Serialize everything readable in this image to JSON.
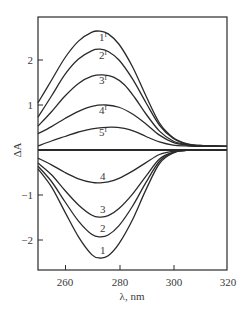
{
  "chart_data": {
    "type": "line",
    "title": "",
    "xlabel": "λ, nm",
    "ylabel": "ΔA",
    "xlim": [
      250,
      320
    ],
    "ylim": [
      -2.7,
      2.95
    ],
    "grid": false,
    "legend": "none (curves labeled inline)",
    "x_ticks": [
      260,
      280,
      300,
      320
    ],
    "x_tick_labels": [
      "260",
      "280",
      "300",
      "320"
    ],
    "y_ticks": [
      2,
      1,
      -1,
      -2
    ],
    "y_tick_labels": [
      "2",
      "1",
      "−1",
      "−2"
    ],
    "series": [
      {
        "name": "1'",
        "label": "1",
        "sup": "I",
        "label_pos": [
          274,
          2.42
        ],
        "x": [
          250,
          255,
          260,
          265,
          270,
          273,
          276,
          280,
          285,
          290,
          295,
          300,
          305,
          310,
          320
        ],
        "values": [
          1.05,
          1.55,
          2.05,
          2.42,
          2.62,
          2.64,
          2.58,
          2.35,
          1.85,
          1.2,
          0.6,
          0.28,
          0.14,
          0.1,
          0.08
        ]
      },
      {
        "name": "2'",
        "label": "2",
        "sup": "I",
        "label_pos": [
          274,
          2.02
        ],
        "x": [
          250,
          255,
          260,
          265,
          270,
          273,
          276,
          280,
          285,
          290,
          295,
          300,
          305,
          310,
          320
        ],
        "values": [
          0.73,
          1.2,
          1.68,
          2.02,
          2.21,
          2.24,
          2.19,
          2.0,
          1.58,
          1.05,
          0.55,
          0.26,
          0.13,
          0.1,
          0.08
        ]
      },
      {
        "name": "3'",
        "label": "3",
        "sup": "I",
        "label_pos": [
          274,
          1.46
        ],
        "x": [
          250,
          255,
          260,
          265,
          270,
          274,
          278,
          282,
          286,
          290,
          295,
          300,
          305,
          310,
          320
        ],
        "values": [
          0.53,
          0.85,
          1.2,
          1.48,
          1.64,
          1.67,
          1.62,
          1.45,
          1.15,
          0.8,
          0.42,
          0.2,
          0.12,
          0.09,
          0.08
        ]
      },
      {
        "name": "4'",
        "label": "4",
        "sup": "I",
        "label_pos": [
          274,
          0.8
        ],
        "x": [
          250,
          255,
          260,
          265,
          270,
          275,
          280,
          285,
          290,
          295,
          300,
          305,
          310,
          320
        ],
        "values": [
          0.36,
          0.52,
          0.7,
          0.86,
          0.97,
          1.0,
          0.95,
          0.8,
          0.58,
          0.33,
          0.17,
          0.11,
          0.09,
          0.08
        ]
      },
      {
        "name": "5'",
        "label": "5",
        "sup": "I",
        "label_pos": [
          274,
          0.32
        ],
        "x": [
          250,
          255,
          260,
          265,
          270,
          277,
          282,
          286,
          290,
          295,
          300,
          305,
          310,
          320
        ],
        "values": [
          0.09,
          0.2,
          0.3,
          0.4,
          0.47,
          0.51,
          0.48,
          0.41,
          0.3,
          0.18,
          0.11,
          0.09,
          0.08,
          0.08
        ]
      },
      {
        "name": "baseline",
        "label": "",
        "sup": "",
        "label_pos": null,
        "x": [
          250,
          320
        ],
        "values": [
          0,
          0
        ]
      },
      {
        "name": "4",
        "label": "4",
        "sup": "",
        "label_pos": [
          274,
          -0.66
        ],
        "x": [
          250,
          255,
          260,
          265,
          270,
          273,
          276,
          280,
          285,
          290,
          295,
          300,
          305,
          320
        ],
        "values": [
          -0.18,
          -0.33,
          -0.5,
          -0.64,
          -0.72,
          -0.73,
          -0.71,
          -0.63,
          -0.47,
          -0.28,
          -0.1,
          -0.03,
          -0.01,
          0
        ]
      },
      {
        "name": "3",
        "label": "3",
        "sup": "",
        "label_pos": [
          274,
          -1.41
        ],
        "x": [
          250,
          255,
          260,
          265,
          270,
          273,
          276,
          280,
          285,
          290,
          295,
          300,
          305,
          320
        ],
        "values": [
          -0.29,
          -0.55,
          -0.9,
          -1.22,
          -1.45,
          -1.49,
          -1.46,
          -1.3,
          -0.98,
          -0.58,
          -0.2,
          -0.05,
          -0.01,
          0
        ]
      },
      {
        "name": "2",
        "label": "2",
        "sup": "",
        "label_pos": [
          274,
          -1.83
        ],
        "x": [
          250,
          255,
          260,
          265,
          270,
          273,
          276,
          280,
          285,
          290,
          295,
          300,
          305,
          320
        ],
        "values": [
          -0.36,
          -0.7,
          -1.15,
          -1.58,
          -1.88,
          -1.93,
          -1.89,
          -1.68,
          -1.25,
          -0.72,
          -0.25,
          -0.06,
          -0.01,
          0
        ]
      },
      {
        "name": "1",
        "label": "1",
        "sup": "",
        "label_pos": [
          274,
          -2.31
        ],
        "x": [
          250,
          255,
          260,
          265,
          270,
          273,
          276,
          280,
          285,
          290,
          295,
          300,
          305,
          320
        ],
        "values": [
          -0.42,
          -0.82,
          -1.38,
          -1.93,
          -2.33,
          -2.4,
          -2.35,
          -2.08,
          -1.55,
          -0.88,
          -0.3,
          -0.07,
          -0.01,
          0
        ]
      }
    ]
  },
  "axes": {
    "xlabel": "λ, nm",
    "ylabel": "ΔA",
    "x_tick_labels": [
      "260",
      "280",
      "300",
      "320"
    ],
    "y_tick_labels": [
      "2",
      "1",
      "−1",
      "−2"
    ]
  }
}
